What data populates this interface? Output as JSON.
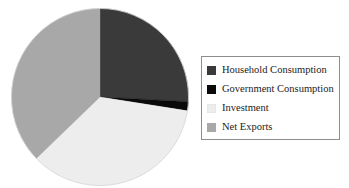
{
  "chart_data": {
    "type": "pie",
    "title": "",
    "xlabel": "",
    "ylabel": "",
    "grid": false,
    "legend_position": "right",
    "start_angle_deg": 0,
    "direction": "clockwise",
    "categories": [
      "Household Consumption",
      "Government Consumption",
      "Investment",
      "Net Exports"
    ],
    "values": [
      25.8,
      1.7,
      35.3,
      37.2
    ],
    "units": "percent of GDP",
    "colors": [
      "#3a3a3a",
      "#0a0a0a",
      "#ededed",
      "#a8a8a8"
    ],
    "slices": [
      {
        "label": "Household Consumption",
        "value": 25.8,
        "color": "#3a3a3a",
        "start_deg": 0.0,
        "end_deg": 93.0
      },
      {
        "label": "Government Consumption",
        "value": 1.7,
        "color": "#0a0a0a",
        "start_deg": 93.0,
        "end_deg": 99.0
      },
      {
        "label": "Investment",
        "value": 35.3,
        "color": "#ededed",
        "start_deg": 99.0,
        "end_deg": 226.0
      },
      {
        "label": "Net Exports",
        "value": 37.2,
        "color": "#a8a8a8",
        "start_deg": 226.0,
        "end_deg": 360.0
      }
    ]
  },
  "legend": {
    "entries": [
      {
        "label": "Household Consumption",
        "color": "#3a3a3a"
      },
      {
        "label": "Government Consumption",
        "color": "#0a0a0a"
      },
      {
        "label": "Investment",
        "color": "#ededed"
      },
      {
        "label": "Net Exports",
        "color": "#a8a8a8"
      }
    ]
  },
  "pie_geometry": {
    "cx": 89,
    "cy": 89,
    "r": 88.5
  }
}
